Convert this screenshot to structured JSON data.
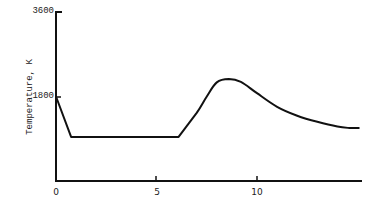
{
  "chart_data": {
    "type": "line",
    "title": "",
    "xlabel": "",
    "ylabel": "Temperature, K",
    "xlim": [
      0,
      15.3
    ],
    "ylim": [
      0,
      3600
    ],
    "x_ticks": [
      "0",
      "5",
      "10"
    ],
    "y_ticks": [
      "1800",
      "3600"
    ],
    "grid": false,
    "legend": null,
    "series": [
      {
        "name": "Temperature",
        "x": [
          0,
          0.75,
          6.1,
          7.0,
          7.5,
          8.0,
          8.6,
          9.2,
          10.0,
          11.0,
          12.0,
          13.0,
          14.0,
          14.6,
          15.1
        ],
        "values": [
          1800,
          940,
          940,
          1450,
          1800,
          2100,
          2170,
          2110,
          1870,
          1580,
          1390,
          1260,
          1160,
          1130,
          1130
        ]
      }
    ]
  },
  "axes": {
    "ylabel": "Temperature, K",
    "y_tick_labels": [
      "3600",
      "1800"
    ],
    "x_tick_labels": [
      "0",
      "5",
      "10"
    ]
  }
}
